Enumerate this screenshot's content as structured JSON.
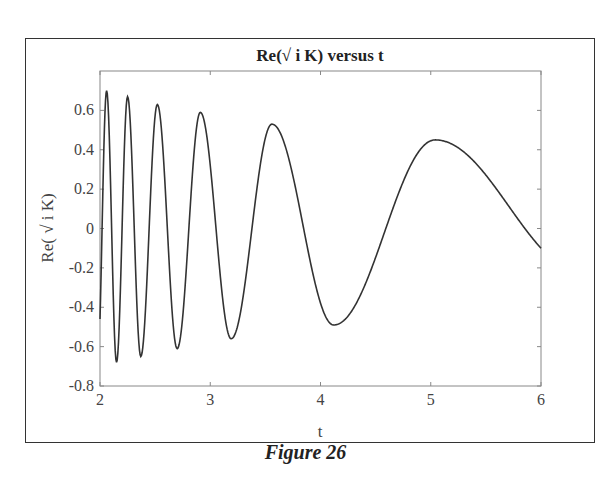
{
  "figure": {
    "caption": "Figure 26"
  },
  "chart_data": {
    "type": "line",
    "title": "Re(√ i K) versus t",
    "xlabel": "t",
    "ylabel": "Re( √ i K)",
    "xlim": [
      2,
      6
    ],
    "ylim": [
      -0.8,
      0.8
    ],
    "xticks": [
      2,
      3,
      4,
      5,
      6
    ],
    "xtick_labels": [
      "2",
      "3",
      "4",
      "5",
      "6"
    ],
    "yticks": [
      -0.8,
      -0.6,
      -0.4,
      -0.2,
      0,
      0.2,
      0.4,
      0.6
    ],
    "ytick_labels": [
      "-0.8",
      "-0.6",
      "-0.4",
      "-0.2",
      "0",
      "0.2",
      "0.4",
      "0.6"
    ],
    "grid": false,
    "legend": null,
    "line_color": "#333333",
    "series": [
      {
        "name": "Re(√ i K)",
        "extrema": [
          {
            "t": 2.0,
            "v": -0.46
          },
          {
            "t": 2.06,
            "v": 0.7
          },
          {
            "t": 2.15,
            "v": -0.68
          },
          {
            "t": 2.25,
            "v": 0.67
          },
          {
            "t": 2.37,
            "v": -0.65
          },
          {
            "t": 2.52,
            "v": 0.63
          },
          {
            "t": 2.7,
            "v": -0.61
          },
          {
            "t": 2.91,
            "v": 0.59
          },
          {
            "t": 3.19,
            "v": -0.56
          },
          {
            "t": 3.56,
            "v": 0.53
          },
          {
            "t": 4.12,
            "v": -0.49
          },
          {
            "t": 5.04,
            "v": 0.45
          },
          {
            "t": 6.0,
            "v": -0.1
          }
        ]
      }
    ]
  }
}
